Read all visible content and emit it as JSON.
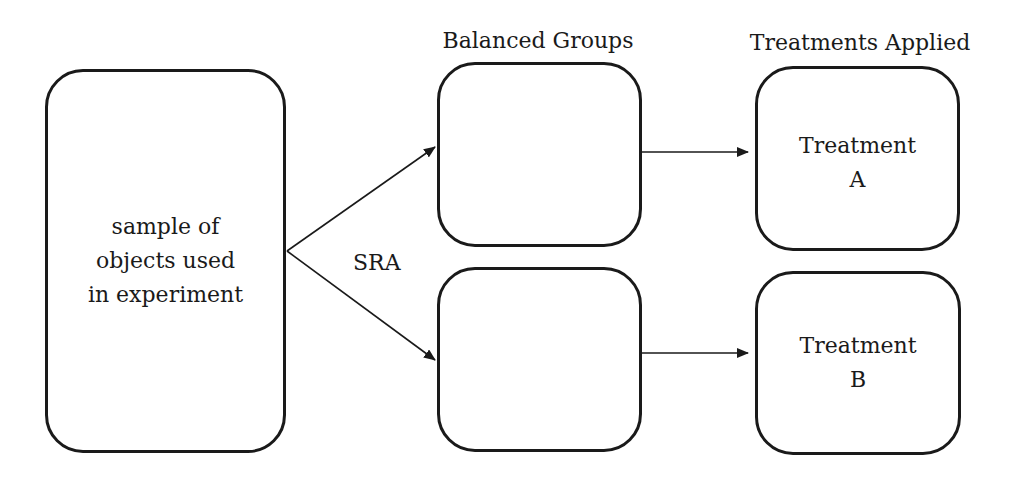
{
  "diagram": {
    "headers": {
      "balanced_groups": "Balanced Groups",
      "treatments_applied": "Treatments Applied"
    },
    "nodes": {
      "sample": {
        "lines": [
          "sample of",
          "objects used",
          "in experiment"
        ]
      },
      "group_a": {
        "lines": []
      },
      "group_b": {
        "lines": []
      },
      "treatment_a": {
        "lines": [
          "Treatment",
          "A"
        ]
      },
      "treatment_b": {
        "lines": [
          "Treatment",
          "B"
        ]
      }
    },
    "edges": [
      {
        "from": "sample",
        "to": "group_a",
        "label": ""
      },
      {
        "from": "sample",
        "to": "group_b",
        "label": ""
      },
      {
        "from": "group_a",
        "to": "treatment_a",
        "label": ""
      },
      {
        "from": "group_b",
        "to": "treatment_b",
        "label": ""
      }
    ],
    "split_label": "SRA",
    "colors": {
      "stroke": "#1a1a1a",
      "background": "#ffffff"
    }
  }
}
